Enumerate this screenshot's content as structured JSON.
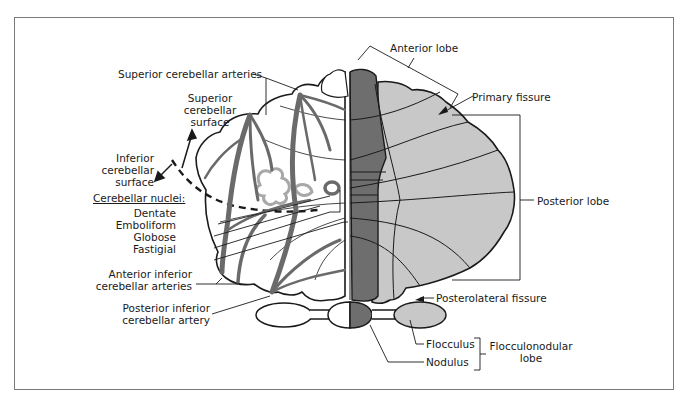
{
  "figure": {
    "type": "anatomical-diagram",
    "colors": {
      "frame": "#7a7a7a",
      "outline": "#1a1a1a",
      "vermis": "#6e6e6e",
      "hemisphere_shaded": "#c8c8c8",
      "artery": "#6a6a6a",
      "nuclei": "#a8a8a8",
      "background": "#ffffff"
    }
  },
  "labels": {
    "superior_cerebellar_arteries": "Superior cerebellar arteries",
    "superior_surface": [
      "Superior",
      "cerebellar",
      "surface"
    ],
    "inferior_surface": [
      "Inferior",
      "cerebellar",
      "surface"
    ],
    "cerebellar_nuclei_heading": "Cerebellar nuclei:",
    "nuclei": [
      "Dentate",
      "Emboliform",
      "Globose",
      "Fastigial"
    ],
    "anterior_inferior_arteries": [
      "Anterior inferior",
      "cerebellar arteries"
    ],
    "posterior_inferior_artery": [
      "Posterior inferior",
      "cerebellar artery"
    ],
    "anterior_lobe": "Anterior lobe",
    "primary_fissure": "Primary fissure",
    "posterior_lobe": "Posterior lobe",
    "posterolateral_fissure": "Posterolateral fissure",
    "flocculus": "Flocculus",
    "nodulus": "Nodulus",
    "flocculonodular_lobe": [
      "Flocculonodular",
      "lobe"
    ]
  }
}
